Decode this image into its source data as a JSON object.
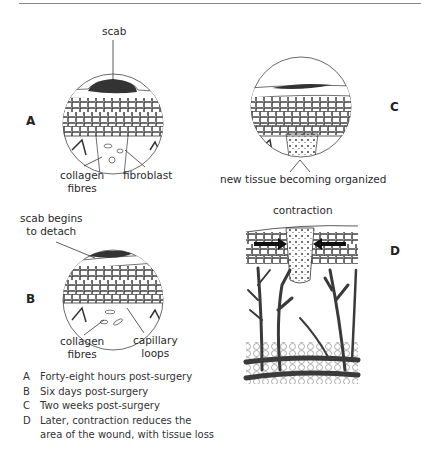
{
  "figure": {
    "panels": [
      {
        "id": "A",
        "letter": "A",
        "labels": {
          "top": "scab",
          "bottom_left": "collagen\nfibres",
          "bottom_right": "fibroblast"
        }
      },
      {
        "id": "B",
        "letter": "B",
        "labels": {
          "top": "scab begins\nto detach",
          "bottom_left": "collagen\nfibres",
          "bottom_right": "capillary\nloops"
        }
      },
      {
        "id": "C",
        "letter": "C",
        "labels": {
          "bottom": "new tissue becoming organized"
        }
      },
      {
        "id": "D",
        "letter": "D",
        "labels": {
          "top": "contraction"
        }
      }
    ],
    "legend": [
      {
        "key": "A",
        "text": "Forty-eight hours post-surgery"
      },
      {
        "key": "B",
        "text": "Six days post-surgery"
      },
      {
        "key": "C",
        "text": "Two weeks post-surgery"
      },
      {
        "key": "D",
        "text": "Later, contraction reduces the"
      },
      {
        "key": "",
        "text": "area of the wound, with tissue loss"
      }
    ],
    "colors": {
      "ink": "#2b2b2b",
      "scab": "#333333",
      "vessel": "#3a3a3a"
    }
  }
}
